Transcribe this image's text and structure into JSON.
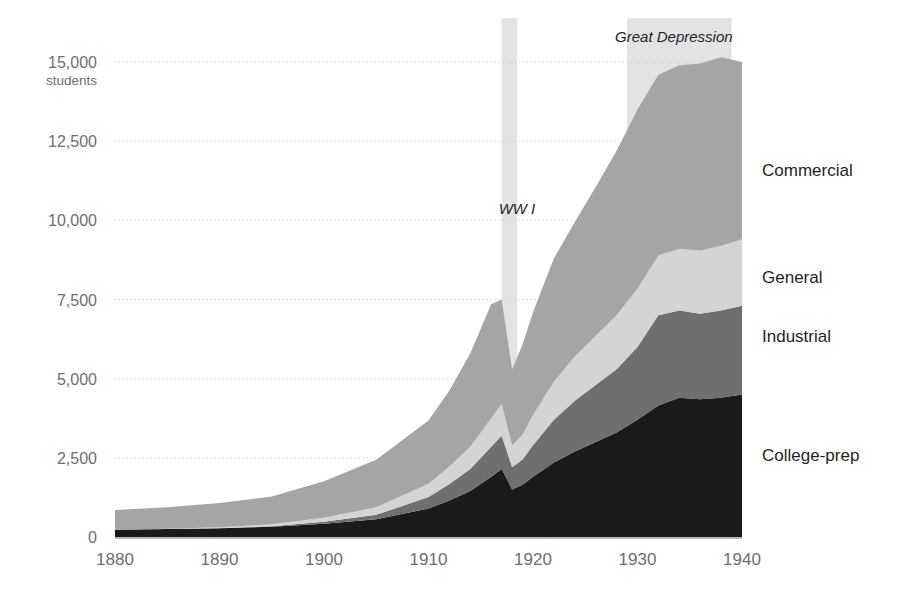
{
  "chart_data": {
    "type": "area",
    "title": "",
    "subtitle": "",
    "xlabel": "",
    "ylabel": "students",
    "xlim": [
      1880,
      1940
    ],
    "ylim": [
      0,
      15000
    ],
    "grid": true,
    "legend_position": "right-inline",
    "stacked": true,
    "x": [
      1880,
      1885,
      1890,
      1895,
      1900,
      1905,
      1910,
      1912,
      1914,
      1916,
      1917,
      1918,
      1919,
      1920,
      1922,
      1924,
      1926,
      1928,
      1930,
      1932,
      1934,
      1936,
      1938,
      1940
    ],
    "series": [
      {
        "name": "College-prep",
        "color": "#1a1a1a",
        "values": [
          230,
          250,
          280,
          320,
          420,
          560,
          900,
          1150,
          1450,
          1900,
          2150,
          1500,
          1650,
          1900,
          2350,
          2700,
          3000,
          3300,
          3700,
          4150,
          4400,
          4350,
          4400,
          4500
        ]
      },
      {
        "name": "Industrial",
        "color": "#6e6f71",
        "values": [
          0,
          0,
          0,
          20,
          60,
          140,
          360,
          520,
          700,
          950,
          1050,
          700,
          800,
          1000,
          1350,
          1600,
          1800,
          2000,
          2300,
          2850,
          2750,
          2700,
          2750,
          2800
        ]
      },
      {
        "name": "General",
        "color": "#d3d4d5",
        "values": [
          0,
          10,
          30,
          60,
          130,
          240,
          420,
          560,
          700,
          900,
          1000,
          700,
          780,
          950,
          1200,
          1400,
          1550,
          1700,
          1850,
          1900,
          1950,
          2000,
          2050,
          2100
        ]
      },
      {
        "name": "Commercial",
        "color": "#a3a5a7",
        "values": [
          620,
          680,
          760,
          880,
          1150,
          1500,
          2000,
          2400,
          2950,
          3600,
          3300,
          2400,
          2850,
          3250,
          3900,
          4250,
          4700,
          5200,
          5650,
          5700,
          5800,
          5900,
          5950,
          5600
        ]
      }
    ],
    "y_ticks": [
      {
        "value": 15000,
        "label": "15,000",
        "sublabel": "students"
      },
      {
        "value": 12500,
        "label": "12,500",
        "sublabel": ""
      },
      {
        "value": 10000,
        "label": "10,000",
        "sublabel": ""
      },
      {
        "value": 7500,
        "label": "7,500",
        "sublabel": ""
      },
      {
        "value": 5000,
        "label": "5,000",
        "sublabel": ""
      },
      {
        "value": 2500,
        "label": "2,500",
        "sublabel": ""
      },
      {
        "value": 0,
        "label": "0",
        "sublabel": ""
      }
    ],
    "x_ticks": [
      {
        "value": 1880,
        "label": "1880"
      },
      {
        "value": 1890,
        "label": "1890"
      },
      {
        "value": 1900,
        "label": "1900"
      },
      {
        "value": 1910,
        "label": "1910"
      },
      {
        "value": 1920,
        "label": "1920"
      },
      {
        "value": 1930,
        "label": "1930"
      },
      {
        "value": 1940,
        "label": "1940"
      }
    ],
    "annotations": [
      {
        "id": "ww1",
        "label": "WW I",
        "start": 1917,
        "end": 1918.5,
        "band_color": "#e2e3e4"
      },
      {
        "id": "great-depression",
        "label": "Great Depression",
        "start": 1929,
        "end": 1939,
        "band_color": "#e2e3e4"
      }
    ],
    "series_labels": [
      {
        "name": "Commercial",
        "y_value": 11600
      },
      {
        "name": "General",
        "y_value": 8200
      },
      {
        "name": "Industrial",
        "y_value": 6350
      },
      {
        "name": "College-prep",
        "y_value": 2600
      }
    ]
  }
}
